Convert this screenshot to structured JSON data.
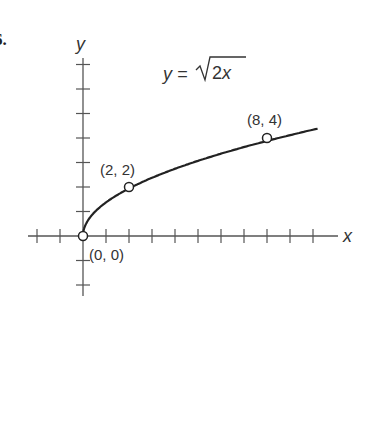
{
  "problem_number": "6.",
  "chart_data": {
    "type": "line",
    "equation_lhs": "y =",
    "equation_radicand": "2x",
    "xlabel": "x",
    "ylabel": "y",
    "xlim": [
      -2,
      11
    ],
    "ylim": [
      -2,
      7
    ],
    "grid": false,
    "x_ticks": [
      -2,
      -1,
      1,
      2,
      3,
      4,
      5,
      6,
      7,
      8,
      9,
      10
    ],
    "y_ticks": [
      -2,
      -1,
      1,
      2,
      3,
      4,
      5,
      6,
      7
    ],
    "series": [
      {
        "name": "y = sqrt(2x)",
        "x": [
          0,
          0.5,
          1,
          2,
          3,
          4,
          5,
          6,
          7,
          8,
          9,
          10
        ],
        "values": [
          0,
          1,
          1.41,
          2,
          2.45,
          2.83,
          3.16,
          3.46,
          3.74,
          4,
          4.24,
          4.47
        ]
      }
    ],
    "points": [
      {
        "x": 0,
        "y": 0,
        "label": "(0, 0)"
      },
      {
        "x": 2,
        "y": 2,
        "label": "(2, 2)"
      },
      {
        "x": 8,
        "y": 4,
        "label": "(8, 4)"
      }
    ]
  }
}
